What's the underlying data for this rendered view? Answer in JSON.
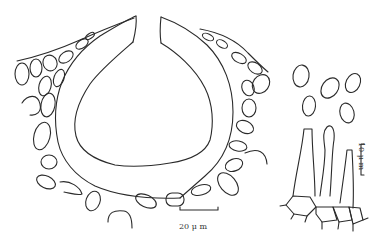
{
  "figure": {
    "panels": [
      {
        "id": "section",
        "name": "fruiting-body-section"
      },
      {
        "id": "spores",
        "name": "spores",
        "count": 5
      },
      {
        "id": "cells",
        "name": "conidiogenous-cells",
        "count": 3
      }
    ],
    "scale_bars": [
      {
        "id": "a",
        "label": "20 μ m",
        "orientation": "horizontal"
      },
      {
        "id": "b",
        "label": "10 μ m",
        "orientation": "vertical"
      }
    ],
    "colors": {
      "line": "#2a2a2a",
      "background": "#ffffff"
    }
  }
}
